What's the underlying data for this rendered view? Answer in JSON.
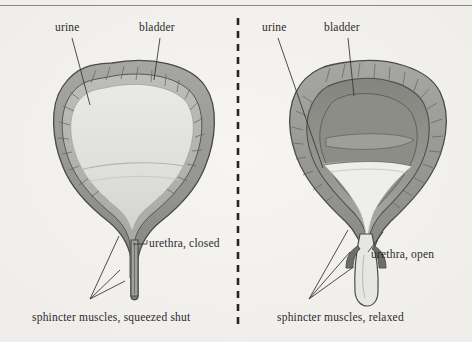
{
  "figure": {
    "background_color": "#f2f1ee",
    "ink_color": "#2b2b2b",
    "panel_divider": "vertical dashed line"
  },
  "panels": [
    {
      "id": "left",
      "state": "bladder full, sphincter closed",
      "labels": {
        "urine": "urine",
        "bladder": "bladder",
        "urethra": "urethra, closed",
        "sphincter": "sphincter muscles, squeezed shut"
      }
    },
    {
      "id": "right",
      "state": "bladder emptying, sphincter relaxed",
      "labels": {
        "urine": "urine",
        "bladder": "bladder",
        "urethra": "urethra, open",
        "sphincter": "sphincter muscles, relaxed"
      }
    }
  ],
  "colors": {
    "paper": "#f2f1ee",
    "muscle_wall": "#9a9a98",
    "muscle_wall_dark": "#6f6f6e",
    "inner_lining": "#b5b5b2",
    "urine_light": "#e3e3e0",
    "urine_lighter": "#eeeeec",
    "outline": "#4a4a49",
    "rule": "#8a8a88"
  }
}
